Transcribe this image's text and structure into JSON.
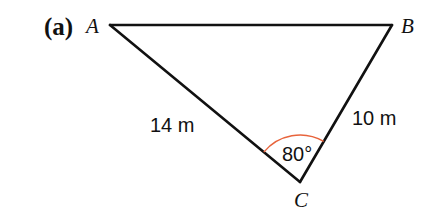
{
  "figure": {
    "part_label": "(a)",
    "vertices": {
      "A": {
        "label": "A",
        "x": 110,
        "y": 25
      },
      "B": {
        "label": "B",
        "x": 392,
        "y": 25
      },
      "C": {
        "label": "C",
        "x": 300,
        "y": 182
      }
    },
    "sides": {
      "AC": {
        "label": "14 m"
      },
      "BC": {
        "label": "10 m"
      }
    },
    "angle_C": {
      "label": "80°",
      "color": "#e8643c"
    },
    "line_color": "#111111"
  }
}
